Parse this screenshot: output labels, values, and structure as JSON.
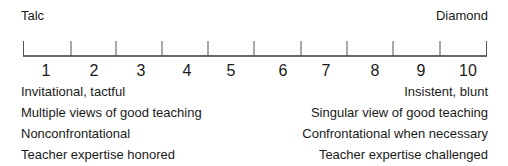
{
  "scale": {
    "left_end_label": "Talc",
    "right_end_label": "Diamond",
    "numbers": [
      "1",
      "2",
      "3",
      "4",
      "5",
      "6",
      "7",
      "8",
      "9",
      "10"
    ],
    "line_color": "#333333"
  },
  "left_descriptors": [
    "Invitational, tactful",
    "Multiple views of good teaching",
    "Nonconfrontational",
    "Teacher expertise honored"
  ],
  "right_descriptors": [
    "Insistent, blunt",
    "Singular view of good teaching",
    "Confrontational when necessary",
    "Teacher expertise challenged"
  ]
}
